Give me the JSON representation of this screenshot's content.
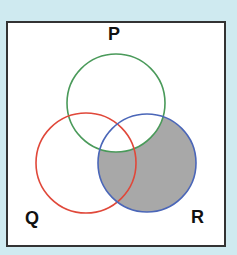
{
  "diagram": {
    "type": "venn",
    "universe": {
      "x": 7,
      "y": 22,
      "w": 218,
      "h": 224,
      "fill": "#ffffff",
      "stroke": "#333333"
    },
    "sets": [
      {
        "label": "P",
        "cx": 116,
        "cy": 103,
        "r": 49,
        "color": "#4a9a5a",
        "label_x": 108,
        "label_y": 24
      },
      {
        "label": "Q",
        "cx": 86,
        "cy": 163,
        "r": 50,
        "color": "#e0483a",
        "label_x": 25,
        "label_y": 208
      },
      {
        "label": "R",
        "cx": 147,
        "cy": 163,
        "r": 49,
        "color": "#4a66b8",
        "label_x": 191,
        "label_y": 207
      }
    ],
    "shaded_region": "R minus P",
    "shade_color": "#a8a8a8"
  }
}
